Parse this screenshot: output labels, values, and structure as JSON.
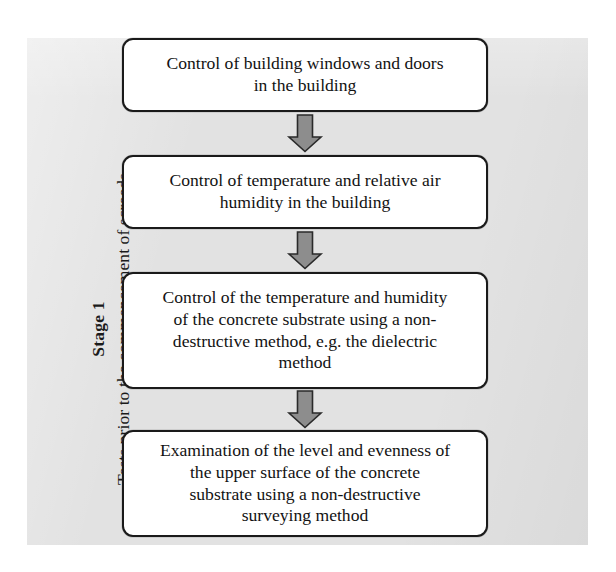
{
  "figure": {
    "background_color": "#e2e2e2",
    "page_color": "#ffffff",
    "box_fill": "#ffffff",
    "box_border_color": "#1a1a1a",
    "arrow_fill": "#8d8d8d",
    "arrow_border_color": "#2a2a2a",
    "text_color": "#121212"
  },
  "stage": {
    "number_label": "Stage 1",
    "caption": "Tests prior to the commencement of  screeds"
  },
  "flow": {
    "nodes": [
      {
        "id": "node-1",
        "lines": [
          "Control of building windows and doors",
          "in the building"
        ],
        "text": "Control of building windows and doors in the building"
      },
      {
        "id": "node-2",
        "lines": [
          "Control of temperature and relative air",
          "humidity in the building"
        ],
        "text": "Control of temperature and relative air humidity in the building"
      },
      {
        "id": "node-3",
        "lines": [
          "Control of the temperature and humidity",
          "of the concrete substrate using a non-",
          "destructive method, e.g. the dielectric",
          "method"
        ],
        "text": "Control of the temperature and humidity of the concrete substrate using a non-destructive method, e.g. the dielectric method"
      },
      {
        "id": "node-4",
        "lines": [
          "Examination of the level and evenness of",
          "the upper surface of the concrete",
          "substrate using a non-destructive",
          "surveying method"
        ],
        "text": "Examination of the level and evenness of the upper surface of the concrete substrate using a non-destructive surveying method"
      }
    ],
    "connectors": [
      {
        "id": "arrow-1",
        "icon": "arrow-down-block-icon",
        "from": "node-1",
        "to": "node-2"
      },
      {
        "id": "arrow-2",
        "icon": "arrow-down-block-icon",
        "from": "node-2",
        "to": "node-3"
      },
      {
        "id": "arrow-3",
        "icon": "arrow-down-block-icon",
        "from": "node-3",
        "to": "node-4"
      }
    ]
  }
}
